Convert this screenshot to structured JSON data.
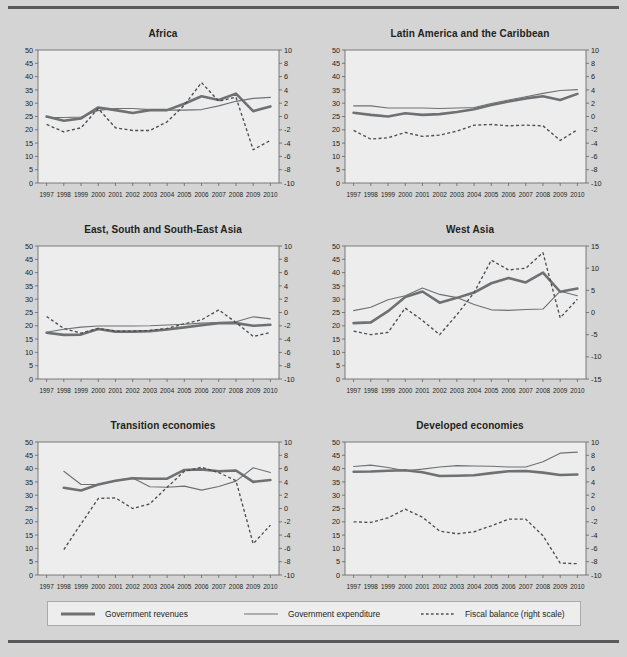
{
  "figure": {
    "background_color": "#d4d4d4",
    "plot_background_color": "#ededed",
    "rule_color": "#58595b"
  },
  "legend": {
    "items": [
      {
        "label": "Government revenues",
        "swatch": "thick-line-swatch",
        "color": "#6f7072",
        "style": "solid-thick"
      },
      {
        "label": "Government expenditure",
        "swatch": "thin-line-swatch",
        "color": "#6f7072",
        "style": "solid-thin"
      },
      {
        "label": "Fiscal balance (right scale)",
        "swatch": "dashed-line-swatch",
        "color": "#4d4d4f",
        "style": "dashed"
      }
    ]
  },
  "chart_data": [
    {
      "type": "line",
      "title": "Africa",
      "xlabel": "",
      "ylabel": "",
      "x": [
        1997,
        1998,
        1999,
        2000,
        2001,
        2002,
        2003,
        2004,
        2005,
        2006,
        2007,
        2008,
        2009,
        2010
      ],
      "xtick_labels": [
        "1997",
        "1998",
        "1999",
        "2000",
        "2001",
        "2002",
        "2003",
        "2004",
        "2005",
        "2006",
        "2007",
        "2008",
        "2009",
        "2010"
      ],
      "ylim": [
        0,
        50
      ],
      "yticks": [
        0,
        5,
        10,
        15,
        20,
        25,
        30,
        35,
        40,
        45,
        50
      ],
      "y2lim": [
        -10,
        10
      ],
      "y2ticks": [
        -10,
        -8,
        -6,
        -4,
        -2,
        0,
        2,
        4,
        6,
        8,
        10
      ],
      "grid": false,
      "legend_position": "bottom-figure",
      "series": [
        {
          "name": "Government revenues",
          "axis": "left",
          "values": [
            25.0,
            23.4,
            24.3,
            28.4,
            27.4,
            26.3,
            27.4,
            27.4,
            29.8,
            32.6,
            31.2,
            33.6,
            27.0,
            28.8
          ]
        },
        {
          "name": "Government expenditure",
          "axis": "left",
          "values": [
            24.6,
            24.6,
            24.8,
            27.3,
            28.0,
            28.0,
            27.6,
            27.4,
            27.4,
            27.6,
            29.0,
            30.7,
            31.8,
            32.2
          ]
        },
        {
          "name": "Fiscal balance (right scale)",
          "axis": "right",
          "values": [
            -1.2,
            -2.3,
            -1.7,
            1.2,
            -1.7,
            -2.1,
            -2.1,
            -0.8,
            1.7,
            5.1,
            2.3,
            2.9,
            -5.0,
            -3.6
          ]
        }
      ]
    },
    {
      "type": "line",
      "title": "Latin America and the Caribbean",
      "xlabel": "",
      "ylabel": "",
      "x": [
        1997,
        1998,
        1999,
        2000,
        2001,
        2002,
        2003,
        2004,
        2005,
        2006,
        2007,
        2008,
        2009,
        2010
      ],
      "xtick_labels": [
        "1997",
        "1998",
        "1999",
        "2000",
        "2001",
        "2002",
        "2003",
        "2004",
        "2005",
        "2006",
        "2007",
        "2008",
        "2009",
        "2010"
      ],
      "ylim": [
        0,
        50
      ],
      "yticks": [
        0,
        5,
        10,
        15,
        20,
        25,
        30,
        35,
        40,
        45,
        50
      ],
      "y2lim": [
        -10,
        10
      ],
      "y2ticks": [
        -10,
        -8,
        -6,
        -4,
        -2,
        0,
        2,
        4,
        6,
        8,
        10
      ],
      "grid": false,
      "legend_position": "bottom-figure",
      "series": [
        {
          "name": "Government revenues",
          "axis": "left",
          "values": [
            26.4,
            25.6,
            25.0,
            26.2,
            25.6,
            25.9,
            26.7,
            27.7,
            29.3,
            30.6,
            31.8,
            32.6,
            31.2,
            33.5
          ]
        },
        {
          "name": "Government expenditure",
          "axis": "left",
          "values": [
            29.0,
            29.0,
            28.2,
            28.2,
            28.2,
            28.0,
            28.2,
            28.4,
            29.9,
            31.2,
            32.4,
            33.7,
            34.8,
            35.1
          ]
        },
        {
          "name": "Fiscal balance (right scale)",
          "axis": "right",
          "values": [
            -2.1,
            -3.4,
            -3.2,
            -2.4,
            -3.0,
            -2.8,
            -2.2,
            -1.3,
            -1.2,
            -1.4,
            -1.3,
            -1.4,
            -3.6,
            -2.0
          ]
        }
      ]
    },
    {
      "type": "line",
      "title": "East, South and South-East Asia",
      "xlabel": "",
      "ylabel": "",
      "x": [
        1997,
        1998,
        1999,
        2000,
        2001,
        2002,
        2003,
        2004,
        2005,
        2006,
        2007,
        2008,
        2009,
        2010
      ],
      "xtick_labels": [
        "1997",
        "1998",
        "1999",
        "2000",
        "2001",
        "2002",
        "2003",
        "2004",
        "2005",
        "2006",
        "2007",
        "2008",
        "2009",
        "2010"
      ],
      "ylim": [
        0,
        50
      ],
      "yticks": [
        0,
        5,
        10,
        15,
        20,
        25,
        30,
        35,
        40,
        45,
        50
      ],
      "y2lim": [
        -10,
        10
      ],
      "y2ticks": [
        -10,
        -8,
        -6,
        -4,
        -2,
        0,
        2,
        4,
        6,
        8,
        10
      ],
      "grid": false,
      "legend_position": "bottom-figure",
      "series": [
        {
          "name": "Government revenues",
          "axis": "left",
          "values": [
            17.4,
            16.6,
            16.7,
            18.8,
            17.8,
            17.8,
            18.0,
            18.6,
            19.4,
            20.2,
            21.0,
            21.0,
            20.0,
            20.4
          ]
        },
        {
          "name": "Government expenditure",
          "axis": "left",
          "values": [
            17.6,
            18.7,
            19.5,
            19.9,
            19.9,
            19.9,
            20.0,
            20.3,
            20.6,
            21.0,
            21.2,
            21.5,
            23.4,
            22.6
          ]
        },
        {
          "name": "Fiscal balance (right scale)",
          "axis": "right",
          "values": [
            -0.6,
            -2.4,
            -3.1,
            -2.4,
            -2.8,
            -2.8,
            -2.7,
            -2.4,
            -1.7,
            -1.1,
            0.4,
            -1.5,
            -3.6,
            -3.0
          ]
        }
      ]
    },
    {
      "type": "line",
      "title": "West Asia",
      "xlabel": "",
      "ylabel": "",
      "x": [
        1997,
        1998,
        1999,
        2000,
        2001,
        2002,
        2003,
        2004,
        2005,
        2006,
        2007,
        2008,
        2009,
        2010
      ],
      "xtick_labels": [
        "1997",
        "1998",
        "1999",
        "2000",
        "2001",
        "2002",
        "2003",
        "2004",
        "2005",
        "2006",
        "2007",
        "2008",
        "2009",
        "2010"
      ],
      "ylim": [
        0,
        50
      ],
      "yticks": [
        0,
        5,
        10,
        15,
        20,
        25,
        30,
        35,
        40,
        45,
        50
      ],
      "y2lim": [
        -15,
        15
      ],
      "y2ticks": [
        -15,
        -10,
        -5,
        0,
        5,
        10,
        15
      ],
      "grid": false,
      "legend_position": "bottom-figure",
      "series": [
        {
          "name": "Government revenues",
          "axis": "left",
          "values": [
            21.0,
            21.3,
            25.5,
            30.8,
            32.9,
            28.7,
            30.5,
            32.5,
            36.0,
            38.0,
            36.3,
            40.0,
            32.8,
            34.0
          ]
        },
        {
          "name": "Government expenditure",
          "axis": "left",
          "values": [
            25.7,
            27.0,
            29.8,
            31.3,
            34.2,
            31.8,
            30.6,
            28.0,
            26.0,
            25.8,
            26.1,
            26.3,
            33.0,
            31.3
          ]
        },
        {
          "name": "Fiscal balance (right scale)",
          "axis": "right",
          "values": [
            -4.2,
            -5.0,
            -4.5,
            1.0,
            -1.8,
            -5.0,
            -0.5,
            4.5,
            11.8,
            9.6,
            10.0,
            13.5,
            -1.2,
            3.0
          ]
        }
      ]
    },
    {
      "type": "line",
      "title": "Transition economies",
      "xlabel": "",
      "ylabel": "",
      "x": [
        1998,
        1999,
        2000,
        2001,
        2002,
        2003,
        2004,
        2005,
        2006,
        2007,
        2008,
        2009,
        2010
      ],
      "xtick_labels": [
        "1997",
        "1998",
        "1999",
        "2000",
        "2001",
        "2002",
        "2003",
        "2004",
        "2005",
        "2006",
        "2007",
        "2008",
        "2009",
        "2010"
      ],
      "ylim": [
        0,
        50
      ],
      "yticks": [
        0,
        5,
        10,
        15,
        20,
        25,
        30,
        35,
        40,
        45,
        50
      ],
      "y2lim": [
        -10,
        10
      ],
      "y2ticks": [
        -10,
        -8,
        -6,
        -4,
        -2,
        0,
        2,
        4,
        6,
        8,
        10
      ],
      "grid": false,
      "legend_position": "bottom-figure",
      "series": [
        {
          "name": "Government revenues",
          "axis": "left",
          "values": [
            32.8,
            31.8,
            34.0,
            35.4,
            36.4,
            36.2,
            36.2,
            39.5,
            39.7,
            39.0,
            39.3,
            35.0,
            35.7
          ]
        },
        {
          "name": "Government expenditure",
          "axis": "left",
          "values": [
            39.0,
            34.0,
            34.0,
            35.4,
            36.5,
            33.2,
            33.0,
            33.4,
            31.9,
            33.3,
            35.3,
            40.3,
            38.5
          ]
        },
        {
          "name": "Fiscal balance (right scale)",
          "axis": "right",
          "values": [
            -6.2,
            -2.3,
            1.5,
            1.6,
            0.0,
            0.7,
            3.2,
            5.6,
            6.2,
            5.4,
            4.2,
            -5.3,
            -2.5
          ]
        }
      ]
    },
    {
      "type": "line",
      "title": "Developed economies",
      "xlabel": "",
      "ylabel": "",
      "x": [
        1997,
        1998,
        1999,
        2000,
        2001,
        2002,
        2003,
        2004,
        2005,
        2006,
        2007,
        2008,
        2009,
        2010
      ],
      "xtick_labels": [
        "1997",
        "1998",
        "1999",
        "2000",
        "2001",
        "2002",
        "2003",
        "2004",
        "2005",
        "2006",
        "2007",
        "2008",
        "2009",
        "2010"
      ],
      "ylim": [
        0,
        50
      ],
      "yticks": [
        0,
        5,
        10,
        15,
        20,
        25,
        30,
        35,
        40,
        45,
        50
      ],
      "y2lim": [
        -10,
        10
      ],
      "y2ticks": [
        -10,
        -8,
        -6,
        -4,
        -2,
        0,
        2,
        4,
        6,
        8,
        10
      ],
      "grid": false,
      "legend_position": "bottom-figure",
      "series": [
        {
          "name": "Government revenues",
          "axis": "left",
          "values": [
            38.8,
            38.9,
            39.2,
            39.4,
            38.6,
            37.2,
            37.3,
            37.5,
            38.3,
            39.0,
            39.1,
            38.5,
            37.6,
            37.8
          ]
        },
        {
          "name": "Government expenditure",
          "axis": "left",
          "values": [
            40.8,
            41.3,
            40.4,
            39.2,
            39.8,
            40.6,
            41.1,
            41.0,
            40.9,
            40.6,
            40.6,
            42.6,
            45.8,
            46.2
          ]
        },
        {
          "name": "Fiscal balance (right scale)",
          "axis": "right",
          "values": [
            -2.0,
            -2.1,
            -1.4,
            -0.1,
            -1.3,
            -3.4,
            -3.8,
            -3.5,
            -2.6,
            -1.6,
            -1.6,
            -4.1,
            -8.2,
            -8.3
          ]
        }
      ]
    }
  ]
}
